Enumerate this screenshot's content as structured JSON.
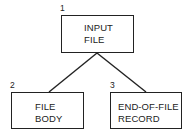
{
  "diagram": {
    "type": "tree",
    "nodes": [
      {
        "id": "1",
        "number": "1",
        "lines": [
          "INPUT",
          "FILE"
        ]
      },
      {
        "id": "2",
        "number": "2",
        "lines": [
          "FILE",
          "BODY"
        ]
      },
      {
        "id": "3",
        "number": "3",
        "lines": [
          "END-OF-FILE",
          "RECORD"
        ]
      }
    ],
    "edges": [
      {
        "from": "1",
        "to": "2"
      },
      {
        "from": "1",
        "to": "3"
      }
    ],
    "colors": {
      "line": "#222222",
      "background": "#ffffff"
    }
  }
}
